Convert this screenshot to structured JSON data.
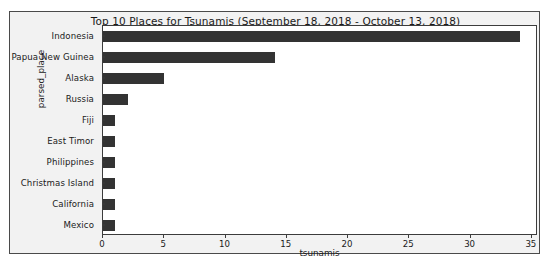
{
  "chart_data": {
    "type": "bar",
    "orientation": "horizontal",
    "title": "Top 10 Places for Tsunamis (September 18, 2018 - October 13, 2018)",
    "xlabel": "tsunamis",
    "ylabel": "parsed_place",
    "categories": [
      "Indonesia",
      "Papua New Guinea",
      "Alaska",
      "Russia",
      "Fiji",
      "East Timor",
      "Philippines",
      "Christmas Island",
      "California",
      "Mexico"
    ],
    "values": [
      34,
      14,
      5,
      2,
      1,
      1,
      1,
      1,
      1,
      1
    ],
    "xlim": [
      0,
      35.5
    ],
    "xticks": [
      0,
      5,
      10,
      15,
      20,
      25,
      30,
      35
    ],
    "xticklabels": [
      "0",
      "5",
      "10",
      "15",
      "20",
      "25",
      "30",
      "35"
    ],
    "grid": false,
    "legend": null,
    "bar_color": "#333333",
    "plot_background": "#ffffff",
    "figure_background": "#f2f2f2"
  }
}
